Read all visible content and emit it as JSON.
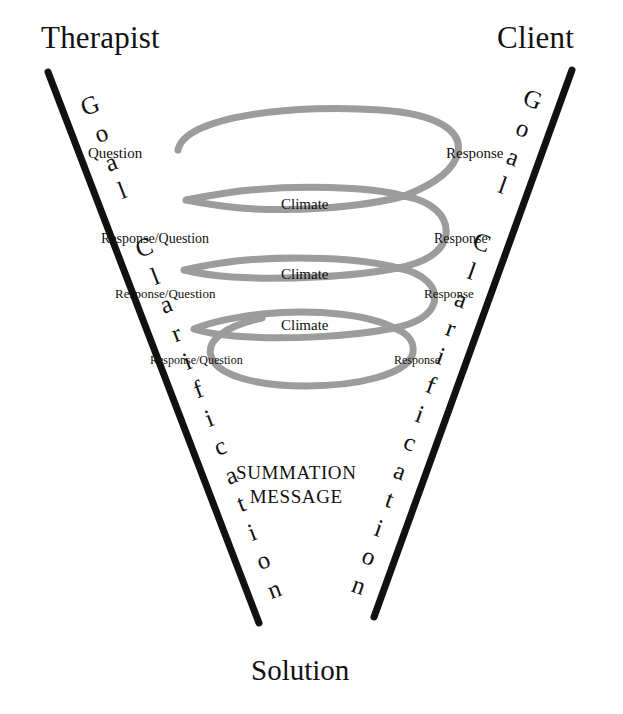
{
  "diagram": {
    "title_left": "Therapist",
    "title_right": "Client",
    "title_bottom": "Solution",
    "axis_left_label": "Goal Clarification",
    "axis_right_label": "Goal Clarification",
    "summation_line1": "SUMMATION",
    "summation_line2": "MESSAGE",
    "colors": {
      "line": "#111111",
      "spiral": "#9c9c9c",
      "text": "#111111",
      "background": "#ffffff"
    },
    "left_exchanges": [
      {
        "label": "Question",
        "x": 88,
        "y": 146,
        "size": 15
      },
      {
        "label": "Response/Question",
        "x": 101,
        "y": 232,
        "size": 14
      },
      {
        "label": "Response/Question",
        "x": 115,
        "y": 287,
        "size": 13
      },
      {
        "label": "Response/Question",
        "x": 150,
        "y": 354,
        "size": 12
      }
    ],
    "right_exchanges": [
      {
        "label": "Response",
        "x": 446,
        "y": 146,
        "size": 15
      },
      {
        "label": "Response",
        "x": 434,
        "y": 232,
        "size": 14
      },
      {
        "label": "Response",
        "x": 424,
        "y": 287,
        "size": 13
      },
      {
        "label": "Response",
        "x": 394,
        "y": 354,
        "size": 12
      }
    ],
    "climate_labels": [
      {
        "label": "Climate",
        "x": 281,
        "y": 197
      },
      {
        "label": "Climate",
        "x": 281,
        "y": 267
      },
      {
        "label": "Climate",
        "x": 281,
        "y": 318
      }
    ]
  }
}
